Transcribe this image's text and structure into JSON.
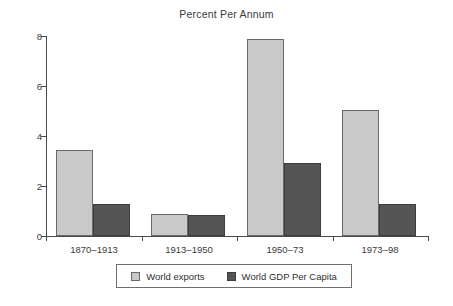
{
  "chart_data": {
    "type": "bar",
    "title": "Percent Per Annum",
    "xlabel": "",
    "ylabel": "",
    "ylim": [
      0,
      8
    ],
    "yticks": [
      0,
      2,
      4,
      6,
      8
    ],
    "grid": false,
    "legend_position": "bottom",
    "categories": [
      "1870–1913",
      "1913–1950",
      "1950–73",
      "1973–98"
    ],
    "series": [
      {
        "name": "World exports",
        "color": "#c9c9c9",
        "values": [
          3.45,
          0.88,
          7.88,
          5.05
        ]
      },
      {
        "name": "World GDP Per Capita",
        "color": "#555555",
        "values": [
          1.28,
          0.85,
          2.92,
          1.28
        ]
      }
    ]
  },
  "legend": {
    "entries": [
      {
        "label": "World exports"
      },
      {
        "label": "World GDP Per Capita"
      }
    ]
  }
}
